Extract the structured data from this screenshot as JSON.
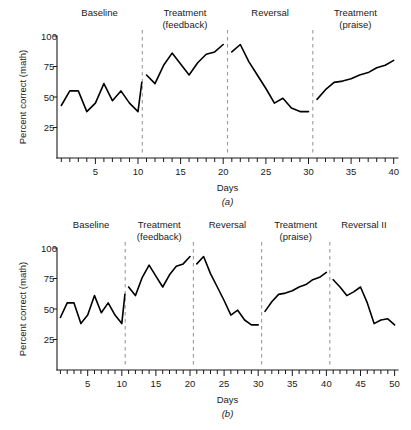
{
  "figures": [
    {
      "id": "a",
      "panel_letter": "(a)",
      "ylabel": "Percent correct (math)",
      "xlabel": "Days",
      "phases": [
        {
          "label_line1": "Baseline",
          "label_line2": "",
          "start": 1,
          "end": 10
        },
        {
          "label_line1": "Treatment",
          "label_line2": "(feedback)",
          "start": 11,
          "end": 20
        },
        {
          "label_line1": "Reversal",
          "label_line2": "",
          "start": 21,
          "end": 30
        },
        {
          "label_line1": "Treatment",
          "label_line2": "(praise)",
          "start": 31,
          "end": 40
        }
      ],
      "dividers": [
        10.5,
        20.5,
        30.5
      ],
      "ytick_labels": [
        "100",
        "75",
        "50",
        "25"
      ],
      "xtick_labels": [
        "5",
        "10",
        "15",
        "20",
        "25",
        "30",
        "35",
        "40"
      ]
    },
    {
      "id": "b",
      "panel_letter": "(b)",
      "ylabel": "Percent correct (math)",
      "xlabel": "Days",
      "phases": [
        {
          "label_line1": "Baseline",
          "label_line2": "",
          "start": 1,
          "end": 10
        },
        {
          "label_line1": "Treatment",
          "label_line2": "(feedback)",
          "start": 11,
          "end": 20
        },
        {
          "label_line1": "Reversal",
          "label_line2": "",
          "start": 21,
          "end": 30
        },
        {
          "label_line1": "Treatment",
          "label_line2": "(praise)",
          "start": 31,
          "end": 40
        },
        {
          "label_line1": "Reversal II",
          "label_line2": "",
          "start": 41,
          "end": 50
        }
      ],
      "dividers": [
        10.5,
        20.5,
        30.5,
        40.5
      ],
      "ytick_labels": [
        "100",
        "75",
        "50",
        "25"
      ],
      "xtick_labels": [
        "5",
        "10",
        "15",
        "20",
        "25",
        "30",
        "35",
        "40",
        "45",
        "50"
      ]
    }
  ],
  "chart_data": [
    {
      "type": "line",
      "title": "(a)",
      "xlabel": "Days",
      "ylabel": "Percent correct (math)",
      "xlim": [
        1,
        40
      ],
      "ylim": [
        0,
        100
      ],
      "yticks": [
        25,
        50,
        75,
        100
      ],
      "xticks": [
        5,
        10,
        15,
        20,
        25,
        30,
        35,
        40
      ],
      "grid": false,
      "legend": "none",
      "phase_annotations": [
        {
          "text": "Baseline",
          "days": [
            1,
            10
          ]
        },
        {
          "text": "Treatment (feedback)",
          "days": [
            11,
            20
          ]
        },
        {
          "text": "Reversal",
          "days": [
            21,
            30
          ]
        },
        {
          "text": "Treatment (praise)",
          "days": [
            31,
            40
          ]
        }
      ],
      "phase_dividers_x": [
        10.5,
        20.5,
        30.5
      ],
      "series": [
        {
          "name": "Baseline",
          "x": [
            1,
            2,
            3,
            4,
            5,
            6,
            7,
            8,
            9,
            10
          ],
          "values": [
            43,
            55,
            55,
            38,
            45,
            61,
            47,
            55,
            45,
            38
          ]
        },
        {
          "name": "Treatment (feedback)",
          "x": [
            11,
            12,
            13,
            14,
            15,
            16,
            17,
            18,
            19,
            20
          ],
          "values": [
            68,
            61,
            76,
            86,
            77,
            68,
            78,
            85,
            87,
            93
          ]
        },
        {
          "name": "Reversal",
          "x": [
            21,
            22,
            23,
            24,
            25,
            26,
            27,
            28,
            29,
            30
          ],
          "values": [
            87,
            93,
            79,
            68,
            57,
            45,
            49,
            41,
            38,
            38
          ]
        },
        {
          "name": "Treatment (praise)",
          "x": [
            31,
            32,
            33,
            34,
            35,
            36,
            37,
            38,
            39,
            40
          ],
          "values": [
            48,
            56,
            62,
            63,
            65,
            68,
            70,
            74,
            76,
            80
          ]
        }
      ],
      "baseline_tail_x": 10.45,
      "baseline_tail_value": 62
    },
    {
      "type": "line",
      "title": "(b)",
      "xlabel": "Days",
      "ylabel": "Percent correct (math)",
      "xlim": [
        1,
        50
      ],
      "ylim": [
        0,
        100
      ],
      "yticks": [
        25,
        50,
        75,
        100
      ],
      "xticks": [
        5,
        10,
        15,
        20,
        25,
        30,
        35,
        40,
        45,
        50
      ],
      "grid": false,
      "legend": "none",
      "phase_annotations": [
        {
          "text": "Baseline",
          "days": [
            1,
            10
          ]
        },
        {
          "text": "Treatment (feedback)",
          "days": [
            11,
            20
          ]
        },
        {
          "text": "Reversal",
          "days": [
            21,
            30
          ]
        },
        {
          "text": "Treatment (praise)",
          "days": [
            31,
            40
          ]
        },
        {
          "text": "Reversal II",
          "days": [
            41,
            50
          ]
        }
      ],
      "phase_dividers_x": [
        10.5,
        20.5,
        30.5,
        40.5
      ],
      "series": [
        {
          "name": "Baseline",
          "x": [
            1,
            2,
            3,
            4,
            5,
            6,
            7,
            8,
            9,
            10
          ],
          "values": [
            43,
            55,
            55,
            38,
            45,
            61,
            47,
            55,
            45,
            38
          ]
        },
        {
          "name": "Treatment (feedback)",
          "x": [
            11,
            12,
            13,
            14,
            15,
            16,
            17,
            18,
            19,
            20
          ],
          "values": [
            68,
            61,
            76,
            86,
            77,
            68,
            78,
            85,
            87,
            93
          ]
        },
        {
          "name": "Reversal",
          "x": [
            21,
            22,
            23,
            24,
            25,
            26,
            27,
            28,
            29,
            30
          ],
          "values": [
            87,
            93,
            79,
            68,
            57,
            45,
            49,
            41,
            37,
            37
          ]
        },
        {
          "name": "Treatment (praise)",
          "x": [
            31,
            32,
            33,
            34,
            35,
            36,
            37,
            38,
            39,
            40
          ],
          "values": [
            48,
            56,
            62,
            63,
            65,
            68,
            70,
            74,
            76,
            80
          ]
        },
        {
          "name": "Reversal II",
          "x": [
            41,
            42,
            43,
            44,
            45,
            46,
            47,
            48,
            49,
            50
          ],
          "values": [
            74,
            68,
            61,
            64,
            68,
            55,
            38,
            41,
            42,
            37
          ]
        }
      ],
      "baseline_tail_x": 10.45,
      "baseline_tail_value": 62
    }
  ]
}
